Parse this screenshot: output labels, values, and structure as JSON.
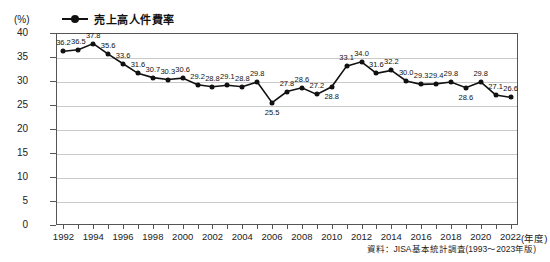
{
  "unit_label": "(%)",
  "legend": {
    "marker_icon": "line-with-dot-marker-icon",
    "label": "売上高人件費率",
    "color": "#111111"
  },
  "x_axis_unit": "(年度)",
  "source_note": "資料：JISA基本統計調査(1993～2023年版)",
  "chart_data": {
    "type": "line",
    "title": "売上高人件費率",
    "xlabel": "(年度)",
    "ylabel": "(%)",
    "ylim": [
      0,
      40
    ],
    "ytick_step": 5,
    "yticks": [
      "40",
      "35",
      "30",
      "25",
      "20",
      "15",
      "10",
      "5",
      "0"
    ],
    "grid": true,
    "legend_position": "top-left",
    "xtick_labels": [
      "1992",
      "1994",
      "1996",
      "1998",
      "2000",
      "2002",
      "2004",
      "2006",
      "2008",
      "2010",
      "2012",
      "2014",
      "2016",
      "2018",
      "2020",
      "2022"
    ],
    "x": [
      1992,
      1993,
      1994,
      1995,
      1996,
      1997,
      1998,
      1999,
      2000,
      2001,
      2002,
      2003,
      2004,
      2005,
      2006,
      2007,
      2008,
      2009,
      2010,
      2011,
      2012,
      2013,
      2014,
      2015,
      2016,
      2017,
      2018,
      2019,
      2020,
      2021,
      2022
    ],
    "series": [
      {
        "name": "売上高人件費率",
        "color": "#111111",
        "values": [
          36.2,
          36.5,
          37.8,
          35.6,
          33.6,
          31.6,
          30.7,
          30.3,
          30.6,
          29.2,
          28.8,
          29.1,
          28.8,
          29.8,
          25.5,
          27.8,
          28.6,
          27.2,
          28.8,
          33.1,
          34.0,
          31.6,
          32.2,
          30.0,
          29.3,
          29.4,
          29.8,
          28.6,
          29.8,
          27.1,
          26.6
        ],
        "labels": [
          "36.2",
          "36.5",
          "37.8",
          "35.6",
          "33.6",
          "31.6",
          "30.7",
          "30.3",
          "30.6",
          "29.2",
          "28.8",
          "29.1",
          "28.8",
          "29.8",
          "25.5",
          "27.8",
          "28.6",
          "27.2",
          "28.8",
          "33.1",
          "34.0",
          "31.6",
          "32.2",
          "30.0",
          "29.3",
          "29.4",
          "29.8",
          "28.6",
          "29.8",
          "27.1",
          "26.6"
        ],
        "label_positions": [
          "above",
          "above",
          "above",
          "above",
          "above",
          "above",
          "above",
          "above",
          "above",
          "above",
          "above",
          "above",
          "above",
          "above",
          "below",
          "above",
          "above",
          "above",
          "below",
          "above",
          "above",
          "above",
          "above",
          "above",
          "above",
          "above",
          "above",
          "below",
          "above",
          "above",
          "above"
        ]
      }
    ]
  }
}
